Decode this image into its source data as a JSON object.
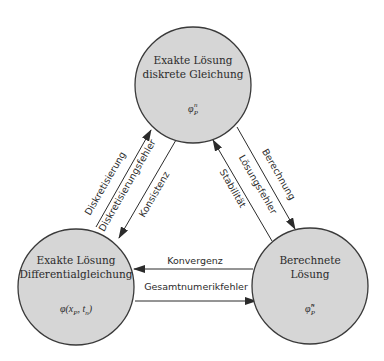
{
  "diagram": {
    "nodes": {
      "top": {
        "title_line1": "Exakte Lösung",
        "title_line2": "diskrete Gleichung",
        "symbol": "φ",
        "symbol_sub": "P",
        "symbol_sup": "n"
      },
      "left": {
        "title_line1": "Exakte Lösung",
        "title_line2": "Differentialgleichung",
        "symbol": "φ(x",
        "symbol_sub": "P",
        "symbol_tail": ", t",
        "symbol_tail_sub": "n",
        "symbol_close": ")"
      },
      "right": {
        "title_line1": "Berechnete",
        "title_line2": "Lösung",
        "symbol": "φ̃",
        "symbol_sub": "P",
        "symbol_sup": "n"
      }
    },
    "edges": {
      "diskretisierung": "Diskretisierung",
      "diskretisierungsfehler": "Diskretisierungsfehler",
      "konsistenz": "Konsistenz",
      "berechnung": "Berechnung",
      "loesungsfehler": "Lösungsfehler",
      "stabilitaet": "Stabilität",
      "konvergenz": "Konvergenz",
      "gesamtnumerikfehler": "Gesamtnumerikfehler"
    },
    "colors": {
      "node_fill": "#d6d6d6",
      "stroke": "#2b2b2b",
      "background": "#ffffff"
    }
  }
}
